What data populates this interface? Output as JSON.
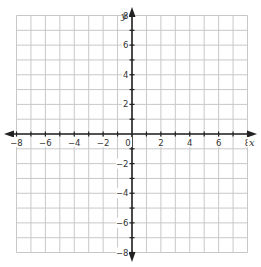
{
  "chart_data": {
    "type": "scatter",
    "title": "",
    "xlabel": "x",
    "ylabel": "y",
    "xlim": [
      -8,
      8
    ],
    "ylim": [
      -8,
      8
    ],
    "grid": true,
    "grid_step": 1,
    "x_tick_labels": [
      "−8",
      "−6",
      "−4",
      "−2",
      "0",
      "2",
      "4",
      "6",
      "8"
    ],
    "x_tick_values": [
      -8,
      -6,
      -4,
      -2,
      0,
      2,
      4,
      6,
      8
    ],
    "y_tick_labels": [
      "8",
      "6",
      "4",
      "2",
      "−2",
      "−4",
      "−6",
      "−8"
    ],
    "y_tick_values": [
      8,
      6,
      4,
      2,
      -2,
      -4,
      -6,
      -8
    ],
    "series": [],
    "colors": {
      "grid": "#c8c8c8",
      "axis": "#222222"
    }
  }
}
